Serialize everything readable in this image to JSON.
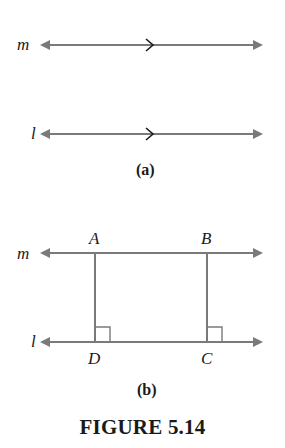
{
  "figure": {
    "caption": "FIGURE 5.14",
    "line_color": "#7a7a7a",
    "text_color": "#1a1a1a"
  },
  "panel_a": {
    "label": "(a)",
    "line_m": {
      "name": "m",
      "parallel_marker": ">"
    },
    "line_l": {
      "name": "l",
      "parallel_marker": ">"
    }
  },
  "panel_b": {
    "label": "(b)",
    "line_m": {
      "name": "m"
    },
    "line_l": {
      "name": "l"
    },
    "points": {
      "A": "A",
      "B": "B",
      "C": "C",
      "D": "D"
    },
    "right_angles": [
      "D",
      "C"
    ]
  }
}
